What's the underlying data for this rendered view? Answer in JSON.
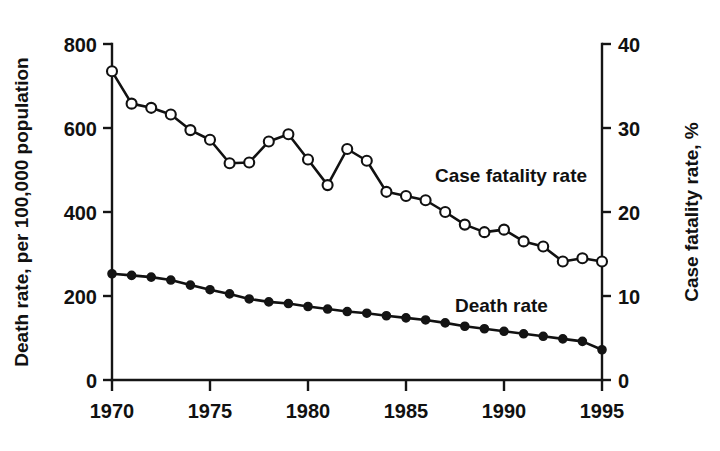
{
  "chart_data": {
    "type": "line",
    "title": "",
    "xlabel": "",
    "ylabel": "Death rate, per 100,000 population",
    "y2label": "Case fatality rate, %",
    "xlim": [
      1970,
      1995
    ],
    "ylim": [
      0,
      800
    ],
    "y2lim": [
      0,
      40
    ],
    "xticks": [
      1970,
      1975,
      1980,
      1985,
      1990,
      1995
    ],
    "xticklabels": [
      "1970",
      "1975",
      "1980",
      "1985",
      "1990",
      "1995"
    ],
    "yticks": [
      0,
      200,
      400,
      600,
      800
    ],
    "yticklabels": [
      "0",
      "200",
      "400",
      "600",
      "800"
    ],
    "y2ticks": [
      0,
      10,
      20,
      30,
      40
    ],
    "y2ticklabels": [
      "0",
      "10",
      "20",
      "30",
      "40"
    ],
    "grid": false,
    "legend": "inline-annotations",
    "x": [
      1970,
      1971,
      1972,
      1973,
      1974,
      1975,
      1976,
      1977,
      1978,
      1979,
      1980,
      1981,
      1982,
      1983,
      1984,
      1985,
      1986,
      1987,
      1988,
      1989,
      1990,
      1991,
      1992,
      1993,
      1994,
      1995
    ],
    "series": [
      {
        "name": "Case fatality rate",
        "axis": "right",
        "marker": "open-circle",
        "unit": "%",
        "values_percent": [
          36.8,
          32.9,
          32.4,
          31.6,
          29.8,
          28.6,
          25.8,
          25.9,
          28.4,
          29.3,
          26.3,
          23.2,
          27.5,
          26.1,
          22.4,
          21.9,
          21.4,
          20.0,
          18.5,
          17.6,
          17.9,
          16.5,
          15.9,
          14.1,
          14.5,
          14.1
        ],
        "values_left_scale": [
          735,
          658,
          648,
          632,
          595,
          572,
          516,
          518,
          568,
          585,
          525,
          464,
          550,
          522,
          448,
          438,
          428,
          400,
          370,
          352,
          358,
          330,
          318,
          282,
          290,
          282
        ]
      },
      {
        "name": "Death rate",
        "axis": "left",
        "marker": "filled-circle",
        "unit": "per 100,000 population",
        "values": [
          253,
          249,
          245,
          238,
          226,
          215,
          205,
          193,
          186,
          182,
          175,
          169,
          163,
          159,
          153,
          148,
          143,
          136,
          128,
          122,
          116,
          110,
          104,
          98,
          92,
          72
        ]
      }
    ],
    "annotations": [
      {
        "text": "Case fatality rate",
        "x": 1988.2,
        "y_right": 22.2
      },
      {
        "text": "Death rate",
        "x": 1987.5,
        "y_left": 182
      }
    ]
  },
  "axes": {
    "left_title": "Death rate, per 100,000 population",
    "right_title": "Case fatality rate, %"
  },
  "labels": {
    "case_fatality": "Case fatality rate",
    "death_rate": "Death rate"
  },
  "colors": {
    "ink": "#111111",
    "background": "#ffffff",
    "marker_open_fill": "#ffffff",
    "marker_filled_fill": "#141414"
  }
}
